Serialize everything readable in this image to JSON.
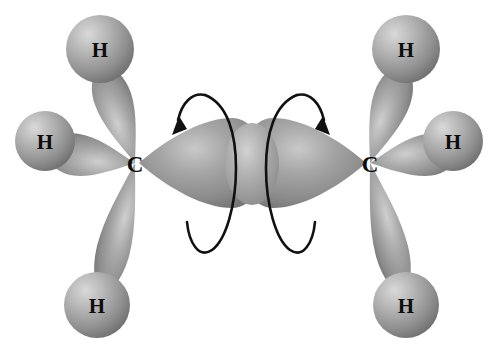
{
  "figure": {
    "type": "molecular-orbital-diagram",
    "molecule": "ethane",
    "background_color": "#ffffff",
    "orbital_fill_color": "#9a9a9a",
    "orbital_highlight_color": "#d8d8d8",
    "orbital_shadow_color": "#6e6e6e",
    "label_color": "#0d0d0d",
    "arrow_color": "#111111"
  },
  "atoms": {
    "carbon": [
      {
        "id": "carbon-left",
        "label": "C",
        "x": 135,
        "y": 163
      },
      {
        "id": "carbon-right",
        "label": "C",
        "x": 370,
        "y": 163
      }
    ],
    "hydrogen": [
      {
        "id": "hydrogen-left-top",
        "label": "H",
        "x": 100,
        "y": 49,
        "r": 34
      },
      {
        "id": "hydrogen-left-side",
        "label": "H",
        "x": 45,
        "y": 141,
        "r": 30
      },
      {
        "id": "hydrogen-left-bottom",
        "label": "H",
        "x": 97,
        "y": 305,
        "r": 33
      },
      {
        "id": "hydrogen-right-top",
        "label": "H",
        "x": 406,
        "y": 49,
        "r": 34
      },
      {
        "id": "hydrogen-right-side",
        "label": "H",
        "x": 453,
        "y": 141,
        "r": 30
      },
      {
        "id": "hydrogen-right-bottom",
        "label": "H",
        "x": 406,
        "y": 305,
        "r": 33
      }
    ]
  },
  "bonds": {
    "sigma_cc": {
      "name": "carbon-carbon-sigma-bond",
      "left_lobe_tip_x": 139,
      "right_lobe_tip_x": 366,
      "overlap_center_x": 252,
      "axis_y": 163
    },
    "ch_bonds": [
      {
        "id": "ch-bond-left-top",
        "from": "carbon-left",
        "to": "hydrogen-left-top"
      },
      {
        "id": "ch-bond-left-side",
        "from": "carbon-left",
        "to": "hydrogen-left-side"
      },
      {
        "id": "ch-bond-left-bottom",
        "from": "carbon-left",
        "to": "hydrogen-left-bottom"
      },
      {
        "id": "ch-bond-right-top",
        "from": "carbon-right",
        "to": "hydrogen-right-top"
      },
      {
        "id": "ch-bond-right-side",
        "from": "carbon-right",
        "to": "hydrogen-right-side"
      },
      {
        "id": "ch-bond-right-bottom",
        "from": "carbon-right",
        "to": "hydrogen-right-bottom"
      }
    ]
  },
  "annotations": {
    "rotation_arrows": [
      {
        "id": "rotation-arrow-left",
        "center_x": 212,
        "direction": "counterclockwise"
      },
      {
        "id": "rotation-arrow-right",
        "center_x": 290,
        "direction": "clockwise"
      }
    ]
  }
}
